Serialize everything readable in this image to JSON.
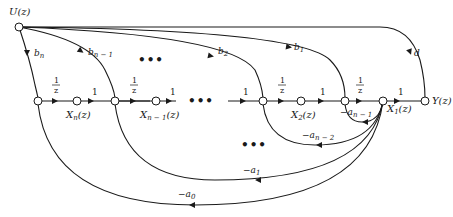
{
  "nodes": {
    "input": "U(z)",
    "output": "Y(z)",
    "states": [
      "X_n(z)",
      "X_{n-1}(z)",
      "X_2(z)",
      "X_1(z)"
    ]
  },
  "labels": {
    "U": "U(z)",
    "Y": "Y(z)",
    "Xn_main": "X",
    "Xn_sub": "n",
    "Xn_tail": "(z)",
    "Xn1_main": "X",
    "Xn1_sub": "n − 1",
    "Xn1_tail": "(z)",
    "X2_main": "X",
    "X2_sub": "2",
    "X2_tail": "(z)",
    "X1_main": "X",
    "X1_sub": "1",
    "X1_tail": "(z)"
  },
  "forward_gains": {
    "delay_num": "1",
    "delay_den": "z",
    "unity": "1"
  },
  "feedforward_gains": [
    {
      "base": "b",
      "sub": "n"
    },
    {
      "base": "b",
      "sub": "n − 1"
    },
    {
      "base": "b",
      "sub": "2"
    },
    {
      "base": "b",
      "sub": "1"
    },
    {
      "base": "d",
      "sub": ""
    }
  ],
  "feedback_gains": [
    {
      "base": "−a",
      "sub": "n − 1"
    },
    {
      "base": "−a",
      "sub": "n − 2"
    },
    {
      "base": "−a",
      "sub": "1"
    },
    {
      "base": "−a",
      "sub": "0"
    }
  ],
  "ellipsis": "•••"
}
